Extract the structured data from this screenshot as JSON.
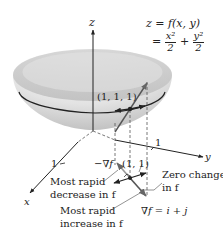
{
  "figure": {
    "type": "diagram",
    "formula": {
      "line1": "z = f(x, y)",
      "line2_prefix": "=",
      "term1_num": "x²",
      "term1_den": "2",
      "plus": "+",
      "term2_num": "y²",
      "term2_den": "2"
    },
    "axes": {
      "z_label": "z",
      "y_label": "y",
      "x_label": "x",
      "y_tick": "1",
      "x_tick": "1"
    },
    "points": {
      "surface_point": "(1, 1, 1)",
      "plane_point": "(1, 1)"
    },
    "vectors": {
      "neg_gradient": "−∇f",
      "gradient_eq": "∇f = i + j"
    },
    "annotations": {
      "decrease_line1": "Most rapid",
      "decrease_line2": "decrease in f",
      "increase_line1": "Most rapid",
      "increase_line2": "increase in f",
      "zero_line1": "Zero change",
      "zero_line2": "in f"
    },
    "colors": {
      "surface_light": "#f2f2f2",
      "surface_dark": "#bdbdbd",
      "ink": "#222222",
      "dashed": "#555555"
    }
  }
}
